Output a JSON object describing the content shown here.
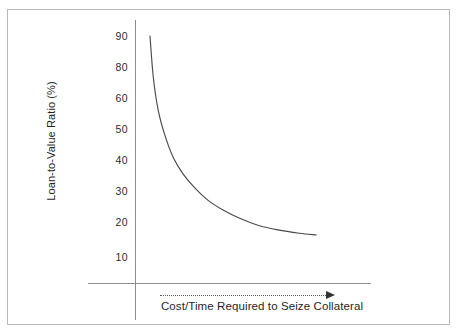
{
  "chart_data": {
    "type": "line",
    "title": "",
    "subtitle": "",
    "xlabel": "Cost/Time Required to Seize Collateral",
    "ylabel": "Loan-to-Value Ratio (%)",
    "ytick_labels": [
      "90",
      "80",
      "60",
      "50",
      "40",
      "30",
      "20",
      "10"
    ],
    "ytick_values": [
      90,
      80,
      60,
      50,
      40,
      30,
      20,
      10
    ],
    "ylim": [
      0,
      95
    ],
    "xlim": [
      0,
      100
    ],
    "x_tick_labels": [],
    "grid": false,
    "legend": null,
    "series": [
      {
        "name": "Loan-to-Value Ratio",
        "color": "#4a4a4a",
        "x": [
          0,
          2,
          5,
          9,
          14,
          20,
          27,
          35,
          44,
          54,
          65,
          77,
          90,
          100
        ],
        "values": [
          90,
          75,
          63,
          54,
          46,
          40,
          35,
          30.5,
          27,
          24,
          21.5,
          19.8,
          18.6,
          18
        ]
      }
    ],
    "annotations": [
      {
        "name": "x-axis-direction-arrow",
        "style": "dotted-line-with-arrowhead",
        "direction": "right"
      }
    ]
  },
  "figure": {
    "axis_color": "#8e8e8e",
    "curve_color": "#4a4a4a",
    "frame_color": "#b9b9b9",
    "background": "#ffffff",
    "text_color": "#1f1f1f"
  }
}
